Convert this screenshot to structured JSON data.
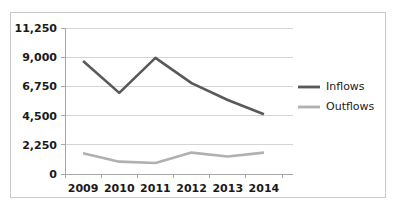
{
  "chart_data": {
    "type": "line",
    "title": "",
    "subtitle": "",
    "xlabel": "",
    "ylabel": "",
    "categories": [
      "2009",
      "2010",
      "2011",
      "2012",
      "2013",
      "2014"
    ],
    "series": [
      {
        "name": "Inflows",
        "values": [
          8700,
          6250,
          8950,
          7000,
          5700,
          4600
        ],
        "color": "#595959"
      },
      {
        "name": "Outflows",
        "values": [
          1600,
          950,
          850,
          1650,
          1350,
          1650
        ],
        "color": "#b0b0b0"
      }
    ],
    "ylim": [
      0,
      11250
    ],
    "yticks": [
      0,
      2250,
      4500,
      6750,
      9000,
      11250
    ],
    "ytick_labels": [
      "0",
      "2,250",
      "4,500",
      "6,750",
      "9,000",
      "11,250"
    ],
    "xtick_labels": [
      "2009",
      "2010",
      "2011",
      "2012",
      "2013",
      "2014"
    ],
    "grid": "horizontal",
    "legend_position": "right",
    "legend_entries": [
      "Inflows",
      "Outflows"
    ],
    "gridline_color": "#d4d4d4",
    "axis_color": "#a6a6a6",
    "border_color": "#c9c9c9",
    "background": "#ffffff"
  }
}
